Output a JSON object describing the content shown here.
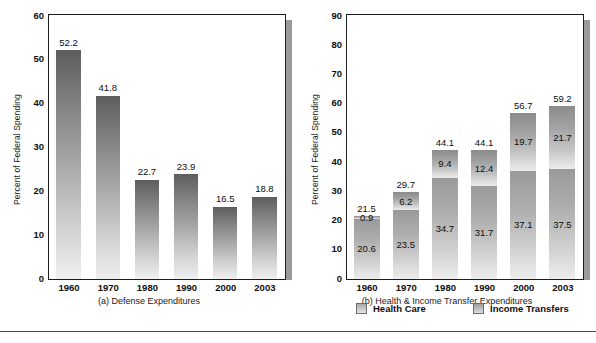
{
  "chart_data": [
    {
      "type": "bar",
      "panel": "a",
      "title": "(a) Defense Expenditures",
      "xlabel": "",
      "ylabel": "Percent of Federal Spending",
      "categories": [
        "1960",
        "1970",
        "1980",
        "1990",
        "2000",
        "2003"
      ],
      "values": [
        52.2,
        41.8,
        22.7,
        23.9,
        16.5,
        18.8
      ],
      "value_labels": [
        "52.2",
        "41.8",
        "22.7",
        "23.9",
        "16.5",
        "18.8"
      ],
      "ylim": [
        0,
        60
      ],
      "yticks": [
        "0",
        "10",
        "20",
        "30",
        "40",
        "50",
        "60"
      ],
      "grid": false,
      "legend": "none"
    },
    {
      "type": "bar",
      "panel": "b",
      "title": "(b) Health & Income Transfer Expenditures",
      "xlabel": "",
      "ylabel": "Percent of Federal Spending",
      "categories": [
        "1960",
        "1970",
        "1980",
        "1990",
        "2000",
        "2003"
      ],
      "stacked": true,
      "series": [
        {
          "name": "Health Care",
          "values": [
            20.6,
            23.5,
            34.7,
            31.7,
            37.1,
            37.5
          ],
          "value_labels": [
            "20.6",
            "23.5",
            "34.7",
            "31.7",
            "37.1",
            "37.5"
          ]
        },
        {
          "name": "Income Transfers",
          "values": [
            0.9,
            6.2,
            9.4,
            12.4,
            19.7,
            21.7
          ],
          "value_labels": [
            "0.9",
            "6.2",
            "9.4",
            "12.4",
            "19.7",
            "21.7"
          ]
        }
      ],
      "totals": [
        21.5,
        29.7,
        44.1,
        44.1,
        56.7,
        59.2
      ],
      "total_labels": [
        "21.5",
        "29.7",
        "44.1",
        "44.1",
        "56.7",
        "59.2"
      ],
      "ylim": [
        0,
        90
      ],
      "yticks": [
        "0",
        "10",
        "20",
        "30",
        "40",
        "50",
        "60",
        "70",
        "80",
        "90"
      ],
      "grid": false,
      "legend": "bottom-center"
    }
  ],
  "panel_a": {
    "ylabel": "Percent of Federal Spending",
    "caption": "(a) Defense Expenditures",
    "yticks": [
      "60",
      "50",
      "40",
      "30",
      "20",
      "10",
      "0"
    ],
    "xticks": [
      "1960",
      "1970",
      "1980",
      "1990",
      "2000",
      "2003"
    ],
    "bars": [
      {
        "label": "1960",
        "value": 52.2,
        "value_label": "52.2"
      },
      {
        "label": "1970",
        "value": 41.8,
        "value_label": "41.8"
      },
      {
        "label": "1980",
        "value": 22.7,
        "value_label": "22.7"
      },
      {
        "label": "1990",
        "value": 23.9,
        "value_label": "23.9"
      },
      {
        "label": "2000",
        "value": 16.5,
        "value_label": "16.5"
      },
      {
        "label": "2003",
        "value": 18.8,
        "value_label": "18.8"
      }
    ]
  },
  "panel_b": {
    "ylabel": "Percent of Federal Spending",
    "caption": "(b) Health & Income Transfer Expenditures",
    "yticks": [
      "90",
      "80",
      "70",
      "60",
      "50",
      "40",
      "30",
      "20",
      "10",
      "0"
    ],
    "xticks": [
      "1960",
      "1970",
      "1980",
      "1990",
      "2000",
      "2003"
    ],
    "bars": [
      {
        "label": "1960",
        "total_label": "21.5",
        "income_label": "0.9",
        "health_label": "20.6",
        "total": 21.5,
        "income": 0.9,
        "health": 20.6
      },
      {
        "label": "1970",
        "total_label": "29.7",
        "income_label": "6.2",
        "health_label": "23.5",
        "total": 29.7,
        "income": 6.2,
        "health": 23.5
      },
      {
        "label": "1980",
        "total_label": "44.1",
        "income_label": "9.4",
        "health_label": "34.7",
        "total": 44.1,
        "income": 9.4,
        "health": 34.7
      },
      {
        "label": "1990",
        "total_label": "44.1",
        "income_label": "12.4",
        "health_label": "31.7",
        "total": 44.1,
        "income": 12.4,
        "health": 31.7
      },
      {
        "label": "2000",
        "total_label": "56.7",
        "income_label": "19.7",
        "health_label": "37.1",
        "total": 56.7,
        "income": 19.7,
        "health": 37.1
      },
      {
        "label": "2003",
        "total_label": "59.2",
        "income_label": "21.7",
        "health_label": "37.5",
        "total": 59.2,
        "income": 21.7,
        "health": 37.5
      }
    ],
    "legend": [
      {
        "label": "Health Care",
        "swatch": "health"
      },
      {
        "label": "Income Transfers",
        "swatch": "income"
      }
    ]
  },
  "colors": {
    "bar_dark": "#5d5d5d",
    "bar_light": "#efefef",
    "frame": "#1d1d1d",
    "shadow": "#9a9a9a",
    "text": "#0e0e0e"
  }
}
